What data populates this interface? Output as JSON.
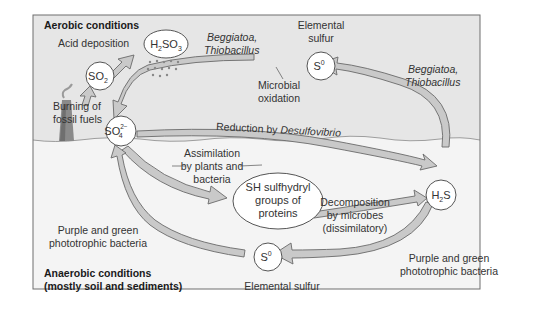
{
  "diagram": {
    "title_top": "Aerobic conditions",
    "title_bottom_line1": "Anaerobic conditions",
    "title_bottom_line2": "(mostly soil and sediments)",
    "colors": {
      "aerobic_bg": "#e6e6e6",
      "anaerobic_bg": "#f4f4f4",
      "arrow_fill": "#c9c9c9",
      "arrow_stroke": "#6a6a6a",
      "frame": "#6e6e6e",
      "smokestack": "#8a8a8a"
    },
    "nodes": {
      "so2": {
        "base": "SO",
        "sub": "2"
      },
      "h2so3": {
        "pre": "H",
        "sub1": "2",
        "mid": "SO",
        "sub2": "3"
      },
      "so4": {
        "base": "SO",
        "sup": "2−",
        "sub": "4"
      },
      "s0_top": {
        "base": "S",
        "sup": "0"
      },
      "s0_bottom": {
        "base": "S",
        "sup": "0"
      },
      "h2s": {
        "pre": "H",
        "sub": "2",
        "post": "S"
      },
      "sh_groups": {
        "line1": "SH sulfhydryl",
        "line2": "groups of",
        "line3": "proteins"
      }
    },
    "labels": {
      "acid_deposition": "Acid deposition",
      "burning_line1": "Burning of",
      "burning_line2": "fossil fuels",
      "beggiatoa_left_line1": "Beggiatoa,",
      "beggiatoa_left_line2": "Thiobacillus",
      "elemental_sulfur_top_line1": "Elemental",
      "elemental_sulfur_top_line2": "sulfur",
      "microbial_line1": "Microbial",
      "microbial_line2": "oxidation",
      "beggiatoa_right_line1": "Beggiatoa,",
      "beggiatoa_right_line2": "Thiobacillus",
      "reduction_prefix": "Reduction by ",
      "reduction_organism": "Desulfovibrio",
      "assimilation_line1": "Assimilation",
      "assimilation_line2": "by plants and",
      "assimilation_line3": "bacteria",
      "decomposition_line1": "Decomposition",
      "decomposition_line2": "by microbes",
      "decomposition_line3": "(dissimilatory)",
      "purple_left_line1": "Purple and green",
      "purple_left_line2": "phototrophic bacteria",
      "purple_right_line1": "Purple and green",
      "purple_right_line2": "phototrophic bacteria",
      "elemental_sulfur_bottom": "Elemental sulfur"
    },
    "icons": {
      "smokestack": "smokestack-icon",
      "rain": "rain-drops-icon"
    }
  }
}
